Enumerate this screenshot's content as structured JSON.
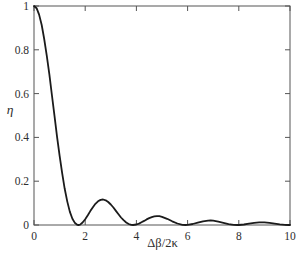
{
  "figure": {
    "background": "#ffffff",
    "frame_color": "#555555",
    "curve_color": "#1b1b1b",
    "text_color": "#2e2e2e"
  },
  "chart_data": {
    "type": "line",
    "title": "",
    "xlabel": "Δβ/2κ",
    "ylabel": "η",
    "xlim": [
      0,
      10
    ],
    "ylim": [
      0,
      1
    ],
    "xticks": [
      0,
      2,
      4,
      6,
      8,
      10
    ],
    "xtick_labels": [
      "0",
      "2",
      "4",
      "6",
      "8",
      "10"
    ],
    "yticks": [
      0,
      0.2,
      0.4,
      0.6,
      0.8,
      1
    ],
    "ytick_labels": [
      "0",
      "0.2",
      "0.4",
      "0.6",
      "0.8",
      "1"
    ],
    "grid": false,
    "legend": null,
    "series": [
      {
        "name": "coupling-efficiency",
        "points": [
          [
            0,
            1.0
          ],
          [
            0.1,
            0.99
          ],
          [
            0.2,
            0.9606
          ],
          [
            0.3,
            0.9131
          ],
          [
            0.4,
            0.8495
          ],
          [
            0.5,
            0.7728
          ],
          [
            0.6,
            0.6863
          ],
          [
            0.7,
            0.5937
          ],
          [
            0.8,
            0.4987
          ],
          [
            0.9,
            0.4052
          ],
          [
            1.0,
            0.3166
          ],
          [
            1.1,
            0.236
          ],
          [
            1.2,
            0.1653
          ],
          [
            1.3,
            0.1067
          ],
          [
            1.4,
            0.0611
          ],
          [
            1.5,
            0.0286
          ],
          [
            1.6,
            0.0088
          ],
          [
            1.7,
            0.0005
          ],
          [
            1.732,
            0.0
          ],
          [
            1.8,
            0.002
          ],
          [
            1.9,
            0.0114
          ],
          [
            2.0,
            0.0263
          ],
          [
            2.1,
            0.0444
          ],
          [
            2.2,
            0.0635
          ],
          [
            2.3,
            0.0815
          ],
          [
            2.4,
            0.0968
          ],
          [
            2.5,
            0.1082
          ],
          [
            2.6,
            0.1148
          ],
          [
            2.7,
            0.1163
          ],
          [
            2.8,
            0.113
          ],
          [
            2.9,
            0.1051
          ],
          [
            3.0,
            0.0936
          ],
          [
            3.1,
            0.0797
          ],
          [
            3.2,
            0.0644
          ],
          [
            3.3,
            0.0489
          ],
          [
            3.4,
            0.0343
          ],
          [
            3.5,
            0.0217
          ],
          [
            3.6,
            0.0116
          ],
          [
            3.7,
            0.0046
          ],
          [
            3.8,
            0.0008
          ],
          [
            3.873,
            0.0
          ],
          [
            4.0,
            0.0022
          ],
          [
            4.1,
            0.0065
          ],
          [
            4.2,
            0.0123
          ],
          [
            4.3,
            0.0189
          ],
          [
            4.4,
            0.0255
          ],
          [
            4.5,
            0.0315
          ],
          [
            4.6,
            0.0362
          ],
          [
            4.7,
            0.0394
          ],
          [
            4.8,
            0.0406
          ],
          [
            4.9,
            0.04
          ],
          [
            5.0,
            0.0375
          ],
          [
            5.2,
            0.0285
          ],
          [
            5.4,
            0.017
          ],
          [
            5.6,
            0.0068
          ],
          [
            5.8,
            0.0009
          ],
          [
            5.916,
            0.0
          ],
          [
            6.0,
            0.0005
          ],
          [
            6.2,
            0.0046
          ],
          [
            6.4,
            0.0111
          ],
          [
            6.6,
            0.0171
          ],
          [
            6.8,
            0.0203
          ],
          [
            6.9,
            0.0205
          ],
          [
            7.0,
            0.0198
          ],
          [
            7.2,
            0.0157
          ],
          [
            7.4,
            0.0099
          ],
          [
            7.6,
            0.0043
          ],
          [
            7.8,
            0.0007
          ],
          [
            7.937,
            0.0
          ],
          [
            8.0,
            0.0001
          ],
          [
            8.2,
            0.0023
          ],
          [
            8.4,
            0.0061
          ],
          [
            8.6,
            0.0098
          ],
          [
            8.8,
            0.0121
          ],
          [
            8.9,
            0.0124
          ],
          [
            9.0,
            0.0121
          ],
          [
            9.2,
            0.0099
          ],
          [
            9.4,
            0.0064
          ],
          [
            9.6,
            0.0029
          ],
          [
            9.8,
            0.0006
          ],
          [
            9.95,
            0.0
          ],
          [
            10.0,
            0.0001
          ]
        ]
      }
    ]
  }
}
